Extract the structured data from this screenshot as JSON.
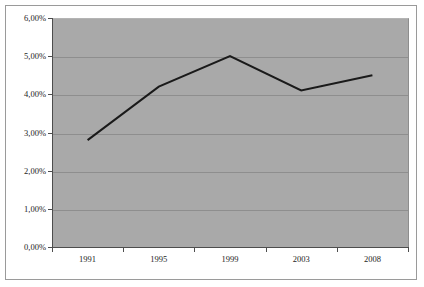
{
  "chart_data": {
    "type": "line",
    "title": "",
    "subtitle": "",
    "xlabel": "",
    "ylabel": "",
    "categories": [
      "1991",
      "1995",
      "1999",
      "2003",
      "2008"
    ],
    "series": [
      {
        "name": "",
        "values": [
          2.8,
          4.2,
          5.0,
          4.1,
          4.5
        ]
      }
    ],
    "ylim": [
      0,
      6
    ],
    "ytick_values": [
      0,
      1,
      2,
      3,
      4,
      5,
      6
    ],
    "ytick_labels": [
      "0,00%",
      "1,00%",
      "2,00%",
      "3,00%",
      "4,00%",
      "5,00%",
      "6,00%"
    ],
    "xtick_labels": [
      "1991",
      "1995",
      "1999",
      "2003",
      "2008"
    ],
    "grid": "horizontal",
    "legend": "none",
    "annotations": []
  },
  "style": {
    "plot_background": "#a9a9a9",
    "page_background": "#ffffff",
    "gridline_color": "#8e8e8e",
    "axis_color": "#4d4d4d",
    "line_color": "#1a1a1a",
    "border_color": "#9a9a9a",
    "text_color": "#1d1d1d",
    "line_width": 2
  }
}
